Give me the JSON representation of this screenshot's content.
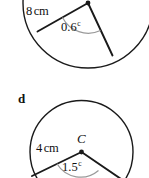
{
  "figure": {
    "type": "geometry-diagram",
    "stroke_color": "#1a1a1a",
    "arc_color": "#9a9a9a",
    "background": "#ffffff",
    "parts": [
      {
        "part_label": "",
        "centre_label": "",
        "radius_text": "8",
        "radius_unit": "cm",
        "angle_value": "0.6",
        "angle_unit": "c",
        "angle_unit_meaning": "radians"
      },
      {
        "part_label": "d",
        "centre_label": "C",
        "radius_text": "4",
        "radius_unit": "cm",
        "angle_value": "1.5",
        "angle_unit": "c",
        "angle_unit_meaning": "radians"
      }
    ]
  }
}
